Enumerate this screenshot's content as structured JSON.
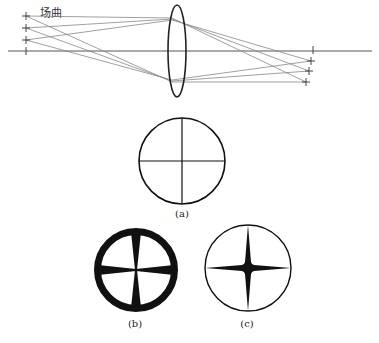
{
  "title": "场曲",
  "diagram": {
    "type": "optics-field-curvature",
    "axis": {
      "y": 51,
      "x1": 8,
      "x2": 372,
      "color": "#555555"
    },
    "lens": {
      "cx": 177,
      "cy": 51,
      "rx": 9,
      "ry": 46,
      "color": "#222222"
    },
    "object_points": [
      {
        "x": 26,
        "y": 16
      },
      {
        "x": 26,
        "y": 28
      },
      {
        "x": 26,
        "y": 40
      },
      {
        "x": 26,
        "y": 51
      }
    ],
    "image_points": [
      {
        "x": 313,
        "y": 50
      },
      {
        "x": 311,
        "y": 61
      },
      {
        "x": 309,
        "y": 71
      },
      {
        "x": 306,
        "y": 82
      }
    ],
    "ray_color": "#888888"
  },
  "panels": [
    {
      "id": "a",
      "label": "(a)",
      "cx": 182,
      "cy": 161,
      "r": 43,
      "style": "thin-cross"
    },
    {
      "id": "b",
      "label": "(b)",
      "cx": 136,
      "cy": 270,
      "r": 42,
      "style": "thick-ring-wedges"
    },
    {
      "id": "c",
      "label": "(c)",
      "cx": 248,
      "cy": 268,
      "r": 43,
      "style": "thin-ring-star"
    }
  ],
  "colors": {
    "ink": "#111111",
    "ray": "#888888",
    "axis": "#555555"
  }
}
